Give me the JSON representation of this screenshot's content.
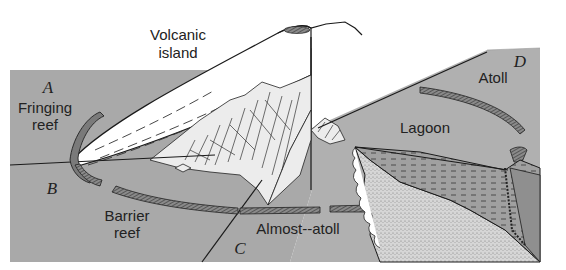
{
  "diagram": {
    "labels": {
      "volcanic_island_line1": "Volcanic",
      "volcanic_island_line2": "island",
      "fringing_reef_line1": "Fringing",
      "fringing_reef_line2": "reef",
      "barrier_reef_line1": "Barrier",
      "barrier_reef_line2": "reef",
      "almost_atoll": "Almost--atoll",
      "atoll": "Atoll",
      "lagoon": "Lagoon"
    },
    "stages": {
      "a": "A",
      "b": "B",
      "c": "C",
      "d": "D"
    },
    "colors": {
      "water": "#a9a9a9",
      "lagoon_water": "#b4b4b4",
      "island": "#ffffff",
      "reef": "#7a7a7a",
      "sediment": "#d2d2d2",
      "deep_section": "#8f8f8f",
      "line": "#1a1a1a"
    }
  }
}
